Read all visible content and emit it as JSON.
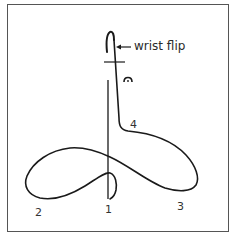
{
  "diagram": {
    "annotation": {
      "text": "wrist flip",
      "arrow": "left-arrow"
    },
    "stroke_labels": [
      {
        "id": "1",
        "text": "1"
      },
      {
        "id": "2",
        "text": "2"
      },
      {
        "id": "3",
        "text": "3"
      },
      {
        "id": "4",
        "text": "4"
      }
    ],
    "symbols": [
      {
        "name": "fermata-icon",
        "description": "arc with dot beneath"
      }
    ],
    "colors": {
      "stroke": "#1a1a1a",
      "frame": "#555555",
      "background": "#ffffff"
    }
  }
}
